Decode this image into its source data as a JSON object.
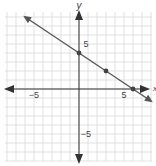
{
  "chart_data": {
    "type": "line",
    "title": "",
    "xlabel": "x",
    "ylabel": "y",
    "xlim": [
      -8,
      8
    ],
    "ylim": [
      -8,
      8
    ],
    "grid": true,
    "tick_labels": {
      "x": [
        {
          "value": -5,
          "label": "−5"
        },
        {
          "value": 5,
          "label": "5"
        }
      ],
      "y": [
        {
          "value": 5,
          "label": "5"
        },
        {
          "value": -5,
          "label": "−5"
        }
      ]
    },
    "series": [
      {
        "name": "line",
        "equation": "y = -2/3 x + 4",
        "slope": -0.6667,
        "intercept": 4,
        "points": [
          {
            "x": 0,
            "y": 4
          },
          {
            "x": 3,
            "y": 2
          },
          {
            "x": 6,
            "y": 0
          }
        ],
        "extends_both_directions": true
      }
    ]
  },
  "colors": {
    "grid": "#d9d9d9",
    "axis": "#333333",
    "line": "#555555",
    "point": "#444444"
  }
}
